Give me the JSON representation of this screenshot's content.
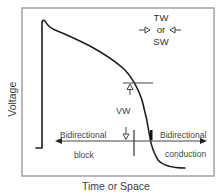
{
  "figure": {
    "axes": {
      "ylabel": "Voltage",
      "xlabel": "Time or Space"
    },
    "wave_label": {
      "line1": "TW",
      "line2": "or",
      "line3": "SW"
    },
    "vulnerable_window_label": "VW",
    "left_region": {
      "line1": "Bidirectional",
      "line2": "block"
    },
    "right_region": {
      "line1": "Bidirectional",
      "line2": "conduction"
    },
    "colors": {
      "frame": "#8a8a8a",
      "curve": "#1e1e1e",
      "annotation": "#3a3a3a"
    }
  }
}
